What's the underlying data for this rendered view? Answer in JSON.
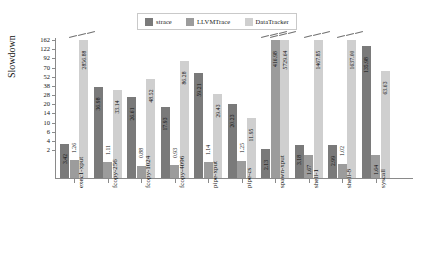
{
  "chart_data": {
    "type": "bar",
    "title": "",
    "xlabel": "",
    "ylabel": "Slowdown",
    "grid": false,
    "legend_position": "top-center",
    "axis_scale": "nonlinear-broken",
    "ylim": [
      0,
      162
    ],
    "ytick_labels": [
      "162",
      "122",
      "92",
      "70",
      "52",
      "38",
      "28",
      "20",
      "14",
      "10",
      "6",
      "4",
      "2"
    ],
    "ytick_values": [
      162,
      122,
      92,
      70,
      52,
      38,
      28,
      20,
      14,
      10,
      6,
      4,
      2
    ],
    "categories": [
      "exec1-xput",
      "fcopy-256",
      "fcopy-1024",
      "fcopy-4096",
      "pipe-xput",
      "pipe-cs",
      "spawn-xput",
      "shell-1",
      "shell-8",
      "syscall"
    ],
    "series": [
      {
        "name": "strace",
        "color": "#7a7a7a",
        "values": [
          3.42,
          36.98,
          26.61,
          17.93,
          59.21,
          20.23,
          2.13,
          3.18,
          2.99,
          135.98
        ],
        "labels": [
          "3.42",
          "36.98",
          "26.61",
          "17.93",
          "59.21",
          "20.23",
          "2.13",
          "3.18",
          "2.99",
          "135.98"
        ]
      },
      {
        "name": "LLVMTrace",
        "color": "#9c9c9c",
        "values": [
          1.26,
          1.11,
          0.88,
          0.93,
          1.14,
          1.25,
          416.98,
          1.67,
          1.02,
          1.64
        ],
        "labels": [
          "1.26",
          "1.11",
          "0.88",
          "0.93",
          "1.14",
          "1.25",
          "416.98",
          "1.67",
          "1.02",
          "1.64"
        ]
      },
      {
        "name": "DataTracker",
        "color": "#cfcfcf",
        "values": [
          2856.88,
          33.14,
          48.52,
          86.28,
          29.43,
          11.95,
          5729.64,
          1467.85,
          1637.0,
          63.63
        ],
        "labels": [
          "2856.88",
          "33.14",
          "48.52",
          "86.28",
          "29.43",
          "11.95",
          "5729.64",
          "1467.85",
          "1637.00",
          "63.63"
        ]
      }
    ],
    "clipped_bars": [
      {
        "category": "exec1-xput",
        "series": "DataTracker"
      },
      {
        "category": "spawn-xput",
        "series": "LLVMTrace"
      },
      {
        "category": "spawn-xput",
        "series": "DataTracker"
      },
      {
        "category": "shell-1",
        "series": "DataTracker"
      },
      {
        "category": "shell-8",
        "series": "DataTracker"
      }
    ]
  },
  "legend": {
    "items": [
      {
        "label": "strace",
        "color": "#7a7a7a"
      },
      {
        "label": "LLVMTrace",
        "color": "#9c9c9c"
      },
      {
        "label": "DataTracker",
        "color": "#cfcfcf"
      }
    ]
  },
  "colors": {
    "strace": "#7a7a7a",
    "llvmtrace": "#9c9c9c",
    "datatracker": "#cfcfcf",
    "axis": "#8a8a8a",
    "text": "#111111",
    "background": "#ffffff"
  }
}
